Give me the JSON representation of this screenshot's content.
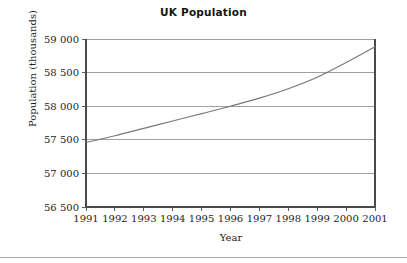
{
  "figure": {
    "title": "UK Population",
    "bottom_rule": true
  },
  "chart_data": {
    "type": "line",
    "title": "UK Population",
    "xlabel": "Year",
    "ylabel": "Population (thousands)",
    "x": [
      1991,
      1992,
      1993,
      1994,
      1995,
      1996,
      1997,
      1998,
      1999,
      2000,
      2001
    ],
    "xtick_labels": [
      "1991",
      "1992",
      "1993",
      "1994",
      "1995",
      "1996",
      "1997",
      "1998",
      "1999",
      "2000",
      "2001"
    ],
    "values": [
      57460,
      57560,
      57670,
      57780,
      57890,
      58000,
      58120,
      58260,
      58430,
      58650,
      58885
    ],
    "series": [
      {
        "name": "UK Population",
        "values": [
          57460,
          57560,
          57670,
          57780,
          57890,
          58000,
          58120,
          58260,
          58430,
          58650,
          58885
        ],
        "color": "#777777"
      }
    ],
    "xlim": [
      1991,
      2001
    ],
    "ylim": [
      56500,
      59000
    ],
    "yticks": [
      56500,
      57000,
      57500,
      58000,
      58500,
      59000
    ],
    "ytick_labels": [
      "56 500",
      "57 000",
      "57 500",
      "58 000",
      "58 500",
      "59 000"
    ],
    "grid": true,
    "grid_axis": "y",
    "grid_color": "#8e8e8e",
    "legend": false,
    "axis_color": "#4a4a4a",
    "background": "#ffffff"
  },
  "plot_geometry": {
    "left": 86,
    "right": 375,
    "top": 39,
    "bottom": 207
  }
}
